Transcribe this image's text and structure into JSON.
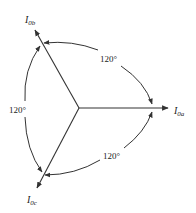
{
  "diagram": {
    "center": {
      "x": 79,
      "y": 108
    },
    "phasors": [
      {
        "id": "a",
        "symbol": "I",
        "subscript": "0a",
        "angle_deg": 0
      },
      {
        "id": "b",
        "symbol": "I",
        "subscript": "0b",
        "angle_deg": 120
      },
      {
        "id": "c",
        "symbol": "I",
        "subscript": "0c",
        "angle_deg": 240
      }
    ],
    "angle_labels": [
      {
        "between": "a-b",
        "text": "120°"
      },
      {
        "between": "b-c",
        "text": "120°"
      },
      {
        "between": "c-a",
        "text": "120°"
      }
    ],
    "colors": {
      "line": "#333333",
      "text": "#222222",
      "background": "#ffffff"
    }
  }
}
